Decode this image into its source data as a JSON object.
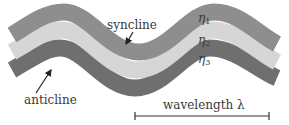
{
  "diagram": {
    "layers": [
      {
        "id": "eta1",
        "label": "η",
        "subscript": "1",
        "color": "#8e8e8e"
      },
      {
        "id": "eta2",
        "label": "η",
        "subscript": "2",
        "color": "#d6d6d6"
      },
      {
        "id": "eta3",
        "label": "η",
        "subscript": "3",
        "color": "#6f6f6f"
      }
    ],
    "annotations": {
      "syncline": "syncline",
      "anticline": "anticline",
      "wavelength": "wavelength λ"
    },
    "colors": {
      "text": "#3a3a3a",
      "arrow": "#222222",
      "background": "#ffffff"
    }
  }
}
